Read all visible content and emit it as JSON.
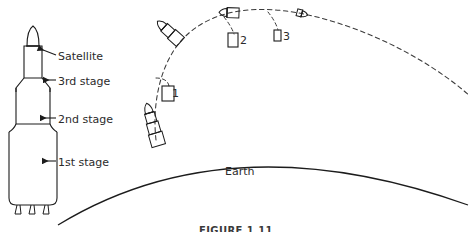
{
  "figure": {
    "caption": "FIGURE 1.11",
    "earth_label": "Earth",
    "line_color": "#1c1c1c",
    "text_color": "#2b2b2b",
    "background": "#ffffff"
  },
  "rocket_diagram": {
    "title": "Multistage rocket cutaway",
    "labels": [
      {
        "id": "satellite",
        "text": "Satellite"
      },
      {
        "id": "stage3",
        "text": "3rd stage"
      },
      {
        "id": "stage2",
        "text": "2nd stage"
      },
      {
        "id": "stage1",
        "text": "1st stage"
      }
    ],
    "nozzle_count": 3
  },
  "trajectory": {
    "style": "dashed",
    "description": "Ballistic ascent arc with sequential stage separations",
    "separation_markers": [
      {
        "label": "1",
        "stage": "1st stage"
      },
      {
        "label": "2",
        "stage": "2nd stage"
      },
      {
        "label": "3",
        "stage": "3rd stage"
      }
    ],
    "payload": "satellite"
  }
}
